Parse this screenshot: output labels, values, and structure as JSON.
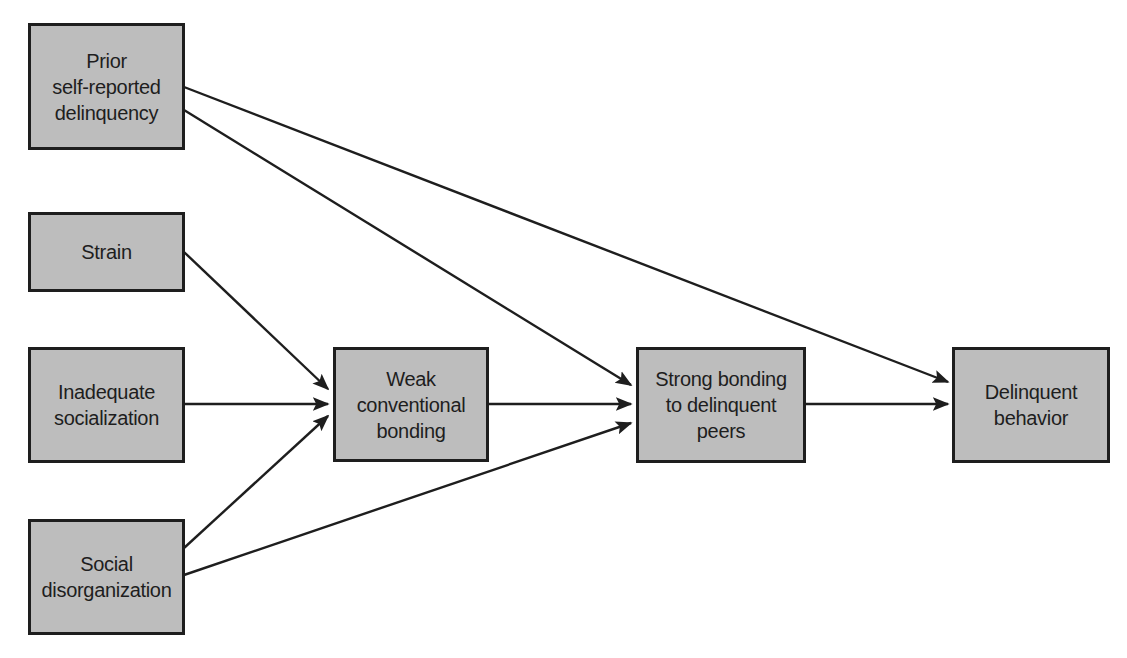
{
  "diagram": {
    "nodes": [
      {
        "id": "prior",
        "label": "Prior\nself-reported\ndelinquency"
      },
      {
        "id": "strain",
        "label": "Strain"
      },
      {
        "id": "inadequate",
        "label": "Inadequate\nsocialization"
      },
      {
        "id": "social",
        "label": "Social\ndisorganization"
      },
      {
        "id": "weak",
        "label": "Weak\nconventional\nbonding"
      },
      {
        "id": "strong",
        "label": "Strong bonding\nto delinquent\npeers"
      },
      {
        "id": "delinquent",
        "label": "Delinquent\nbehavior"
      }
    ],
    "edges": [
      {
        "from": "prior",
        "to": "delinquent"
      },
      {
        "from": "prior",
        "to": "strong"
      },
      {
        "from": "strain",
        "to": "weak"
      },
      {
        "from": "inadequate",
        "to": "weak"
      },
      {
        "from": "social",
        "to": "weak"
      },
      {
        "from": "social",
        "to": "strong"
      },
      {
        "from": "weak",
        "to": "strong"
      },
      {
        "from": "strong",
        "to": "delinquent"
      }
    ],
    "colors": {
      "box_fill": "#bdbdbd",
      "stroke": "#1e1e1e",
      "background": "#ffffff"
    }
  }
}
